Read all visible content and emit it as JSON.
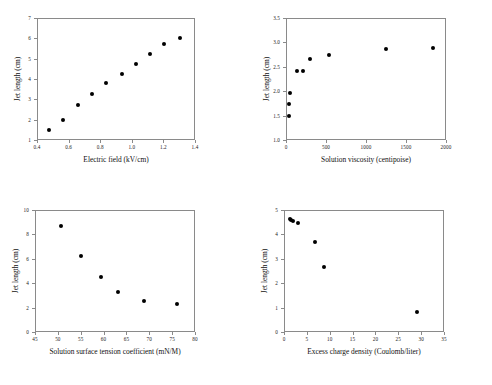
{
  "figure": {
    "background": "#ffffff",
    "marker_color": "#000000",
    "axis_color": "#8a8a8a",
    "panel_count": 4
  },
  "chart_data": [
    {
      "type": "scatter",
      "panel": "top-left",
      "title": "",
      "xlabel": "Electric field (kV/cm)",
      "ylabel": "Jet length (cm)",
      "xlim": [
        0.4,
        1.4
      ],
      "ylim": [
        1,
        7
      ],
      "xticks": [
        0.4,
        0.6,
        0.8,
        1.0,
        1.2,
        1.4
      ],
      "xticklabels": [
        "0.4",
        "0.6",
        "0.8",
        "1.0",
        "1.2",
        "1.4"
      ],
      "yticks": [
        1,
        2,
        3,
        4,
        5,
        6,
        7
      ],
      "yticklabels": [
        "1",
        "2",
        "3",
        "4",
        "5",
        "6",
        "7"
      ],
      "grid": false,
      "legend": "none",
      "x": [
        0.47,
        0.56,
        0.65,
        0.74,
        0.83,
        0.93,
        1.02,
        1.11,
        1.2,
        1.3
      ],
      "y": [
        1.55,
        2.05,
        2.78,
        3.32,
        3.85,
        4.28,
        4.79,
        5.29,
        5.78,
        6.08
      ]
    },
    {
      "type": "scatter",
      "panel": "top-right",
      "title": "",
      "xlabel": "Solution viscosity (centipoise)",
      "ylabel": "Jet length (cm)",
      "xlim": [
        0,
        2000
      ],
      "ylim": [
        1.0,
        3.5
      ],
      "xticks": [
        0,
        500,
        1000,
        1500,
        2000
      ],
      "xticklabels": [
        "0",
        "500",
        "1000",
        "1500",
        "2000"
      ],
      "yticks": [
        1.0,
        1.5,
        2.0,
        2.5,
        3.0,
        3.5
      ],
      "yticklabels": [
        "1.0",
        "1.5",
        "2.0",
        "2.5",
        "3.0",
        "3.5"
      ],
      "grid": false,
      "legend": "none",
      "x": [
        20,
        25,
        35,
        120,
        200,
        290,
        530,
        1240,
        1830
      ],
      "y": [
        1.52,
        1.75,
        1.99,
        2.44,
        2.44,
        2.68,
        2.77,
        2.89,
        2.91
      ]
    },
    {
      "type": "scatter",
      "panel": "bottom-left",
      "title": "",
      "xlabel": "Solution surface tension coefficient (mN/M)",
      "ylabel": "Jet length (cm)",
      "xlim": [
        45,
        80
      ],
      "ylim": [
        0,
        10
      ],
      "xticks": [
        45,
        50,
        55,
        60,
        65,
        70,
        75,
        80
      ],
      "xticklabels": [
        "45",
        "50",
        "55",
        "60",
        "65",
        "70",
        "75",
        "80"
      ],
      "yticks": [
        0,
        2,
        4,
        6,
        8,
        10
      ],
      "yticklabels": [
        "0",
        "2",
        "4",
        "6",
        "8",
        "10"
      ],
      "grid": false,
      "legend": "none",
      "x": [
        50.5,
        54.8,
        59.3,
        63.0,
        68.7,
        75.8
      ],
      "y": [
        8.8,
        6.3,
        4.6,
        3.35,
        2.65,
        2.35
      ]
    },
    {
      "type": "scatter",
      "panel": "bottom-right",
      "title": "",
      "xlabel": "Excess charge density (Coulomb/liter)",
      "ylabel": "Jet length (cm)",
      "xlim": [
        0,
        35
      ],
      "ylim": [
        0,
        5
      ],
      "xticks": [
        0,
        5,
        10,
        15,
        20,
        25,
        30,
        35
      ],
      "xticklabels": [
        "0",
        "5",
        "10",
        "15",
        "20",
        "25",
        "30",
        "35"
      ],
      "yticks": [
        0,
        1,
        2,
        3,
        4,
        5
      ],
      "yticklabels": [
        "0",
        "1",
        "2",
        "3",
        "4",
        "5"
      ],
      "grid": false,
      "legend": "none",
      "x": [
        1.1,
        1.4,
        1.7,
        2.9,
        6.6,
        8.6,
        28.9
      ],
      "y": [
        4.68,
        4.64,
        4.6,
        4.5,
        3.73,
        2.7,
        0.86
      ]
    }
  ]
}
